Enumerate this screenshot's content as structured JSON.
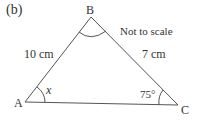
{
  "part_label": "(b)",
  "note": "Not to scale",
  "vertices": {
    "A": {
      "label": "A",
      "x": 25,
      "y": 102
    },
    "B": {
      "label": "B",
      "x": 91,
      "y": 17
    },
    "C": {
      "label": "C",
      "x": 178,
      "y": 105
    }
  },
  "sides": {
    "AB": "10 cm",
    "BC": "7 cm"
  },
  "angles": {
    "A": "x",
    "C": "75°"
  },
  "colors": {
    "line": "#444444",
    "text": "#333333"
  }
}
